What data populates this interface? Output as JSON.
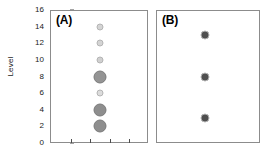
{
  "chart_data": {
    "type": "scatter",
    "title": "",
    "xlabel": "",
    "ylabel": "Level",
    "ylim": [
      0,
      16
    ],
    "ytick_labels": [
      "16",
      "14",
      "12",
      "10",
      "8",
      "6",
      "4",
      "2",
      "0"
    ],
    "ytick_values": [
      16,
      14,
      12,
      10,
      8,
      6,
      4,
      2,
      0
    ],
    "grid": false,
    "legend": "none",
    "panels": [
      {
        "label": "(A)",
        "x_position": 0.5,
        "n_xticks": 4,
        "points": [
          {
            "level": 14,
            "size": 7,
            "color": "#d4d4d4"
          },
          {
            "level": 12,
            "size": 7,
            "color": "#d4d4d4"
          },
          {
            "level": 10,
            "size": 7,
            "color": "#d0d0d0"
          },
          {
            "level": 8,
            "size": 13,
            "color": "#949494"
          },
          {
            "level": 6,
            "size": 7,
            "color": "#dcdcdc"
          },
          {
            "level": 4,
            "size": 13,
            "color": "#8e8e8e"
          },
          {
            "level": 2,
            "size": 13,
            "color": "#8e8e8e"
          }
        ]
      },
      {
        "label": "(B)",
        "x_position": 0.46,
        "n_xticks": 0,
        "points": [
          {
            "level": 13,
            "size": 9,
            "color": "#4f4f4f"
          },
          {
            "level": 8,
            "size": 9,
            "color": "#4f4f4f"
          },
          {
            "level": 3,
            "size": 9,
            "color": "#4f4f4f"
          }
        ]
      }
    ]
  },
  "axis": {
    "ylabel": "Level"
  },
  "colors": {
    "frame": "#8c8c8c",
    "text": "#1a1a1a",
    "background": "#ffffff"
  }
}
